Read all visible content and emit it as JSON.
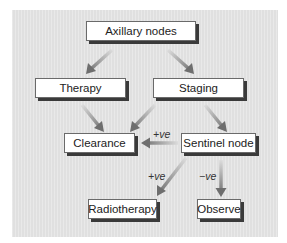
{
  "diagram": {
    "nodes": {
      "axillary": "Axillary nodes",
      "therapy": "Therapy",
      "staging": "Staging",
      "clearance": "Clearance",
      "sentinel": "Sentinel node",
      "radiotherapy": "Radiotherapy",
      "observe": "Observe"
    },
    "edge_labels": {
      "sentinel_to_clearance": "+ve",
      "sentinel_to_radiotherapy": "+ve",
      "sentinel_to_observe": "−ve"
    },
    "edges": [
      {
        "from": "Axillary nodes",
        "to": "Therapy"
      },
      {
        "from": "Axillary nodes",
        "to": "Staging"
      },
      {
        "from": "Therapy",
        "to": "Clearance"
      },
      {
        "from": "Staging",
        "to": "Clearance"
      },
      {
        "from": "Staging",
        "to": "Sentinel node"
      },
      {
        "from": "Sentinel node",
        "to": "Clearance",
        "label": "+ve"
      },
      {
        "from": "Sentinel node",
        "to": "Radiotherapy",
        "label": "+ve"
      },
      {
        "from": "Sentinel node",
        "to": "Observe",
        "label": "−ve"
      }
    ],
    "colors": {
      "panel": "#e4e4e4",
      "box_fill": "#ffffff",
      "box_shadow": "#3a3a3a",
      "arrow_dark": "#6e6e6e",
      "arrow_light": "#d6d6d6"
    }
  }
}
